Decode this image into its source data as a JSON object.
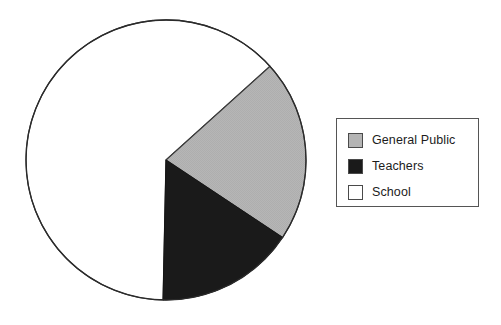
{
  "chart_data": {
    "type": "pie",
    "title": "",
    "subtitle": "",
    "xlabel": "",
    "ylabel": "",
    "grid": false,
    "legend_position": "right",
    "start_angle_deg": -42,
    "direction": "clockwise",
    "categories": [
      "General Public",
      "Teachers",
      "School"
    ],
    "values": [
      21,
      16,
      63
    ],
    "value_unit": "%",
    "colors": [
      "#b4b4b4",
      "#1a1a1a",
      "#ffffff"
    ],
    "slices": [
      {
        "label": "General Public",
        "value": 21,
        "color": "#b4b4b4",
        "angle_deg": 76,
        "border_color": "#333333"
      },
      {
        "label": "Teachers",
        "value": 16,
        "color": "#1a1a1a",
        "angle_deg": 58,
        "border_color": "#1a1a1a"
      },
      {
        "label": "School",
        "value": 63,
        "color": "#ffffff",
        "angle_deg": 226,
        "border_color": "#333333"
      }
    ],
    "geometry": {
      "center_x": 166,
      "center_y": 160,
      "radius": 140,
      "outline_color": "#2b2b2b"
    }
  },
  "legend": {
    "items": [
      {
        "label": "General Public",
        "swatch_color": "#b4b4b4"
      },
      {
        "label": "Teachers",
        "swatch_color": "#1a1a1a"
      },
      {
        "label": "School",
        "swatch_color": "#ffffff"
      }
    ],
    "border_color": "#555555",
    "background": "#ffffff"
  }
}
